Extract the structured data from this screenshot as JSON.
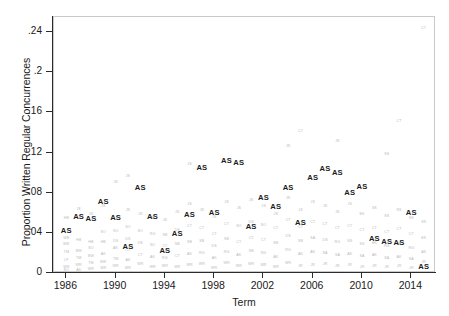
{
  "chart_data": {
    "type": "scatter",
    "title": "",
    "xlabel": "Term",
    "ylabel": "Proportion Written Regular Concurrences",
    "xlim": [
      1985,
      2016
    ],
    "ylim": [
      0,
      0.255
    ],
    "xticks": [
      "1986",
      "1990",
      "1994",
      "1998",
      "2002",
      "2006",
      "2010",
      "2014"
    ],
    "xtick_values": [
      1986,
      1990,
      1994,
      1998,
      2002,
      2006,
      2010,
      2014
    ],
    "yticks": [
      "0",
      ".04",
      ".08",
      ".12",
      ".16",
      ".2",
      ".24"
    ],
    "ytick_values": [
      0,
      0.04,
      0.08,
      0.12,
      0.16,
      0.2,
      0.24
    ],
    "grid": false,
    "legend": false,
    "marker_style": "text-initials",
    "series": [
      {
        "name": "Scalia",
        "label": "AS",
        "color": "#1c1c1c",
        "emphasis": "bold",
        "points": [
          {
            "x": 1986,
            "y": 0.042
          },
          {
            "x": 1987,
            "y": 0.056
          },
          {
            "x": 1988,
            "y": 0.054
          },
          {
            "x": 1989,
            "y": 0.071
          },
          {
            "x": 1990,
            "y": 0.055
          },
          {
            "x": 1991,
            "y": 0.026
          },
          {
            "x": 1992,
            "y": 0.085
          },
          {
            "x": 1993,
            "y": 0.056
          },
          {
            "x": 1994,
            "y": 0.022
          },
          {
            "x": 1995,
            "y": 0.039
          },
          {
            "x": 1996,
            "y": 0.058
          },
          {
            "x": 1997,
            "y": 0.105
          },
          {
            "x": 1998,
            "y": 0.06
          },
          {
            "x": 1999,
            "y": 0.112
          },
          {
            "x": 2000,
            "y": 0.11
          },
          {
            "x": 2001,
            "y": 0.046
          },
          {
            "x": 2002,
            "y": 0.075
          },
          {
            "x": 2003,
            "y": 0.066
          },
          {
            "x": 2004,
            "y": 0.085
          },
          {
            "x": 2005,
            "y": 0.05
          },
          {
            "x": 2006,
            "y": 0.095
          },
          {
            "x": 2007,
            "y": 0.104
          },
          {
            "x": 2008,
            "y": 0.1
          },
          {
            "x": 2009,
            "y": 0.08
          },
          {
            "x": 2010,
            "y": 0.086
          },
          {
            "x": 2011,
            "y": 0.034
          },
          {
            "x": 2012,
            "y": 0.031
          },
          {
            "x": 2013,
            "y": 0.03
          },
          {
            "x": 2014,
            "y": 0.06
          },
          {
            "x": 2015,
            "y": 0.006
          }
        ]
      },
      {
        "name": "Other Justices",
        "color": "#b9b9b9",
        "emphasis": "normal",
        "points": [
          {
            "x": 1986,
            "y": 0.054,
            "label": "HB"
          },
          {
            "x": 1986,
            "y": 0.034,
            "label": "WB"
          },
          {
            "x": 1986,
            "y": 0.028,
            "label": "BW"
          },
          {
            "x": 1986,
            "y": 0.02,
            "label": "TM"
          },
          {
            "x": 1986,
            "y": 0.012,
            "label": "LP"
          },
          {
            "x": 1986,
            "y": 0.005,
            "label": "WR"
          },
          {
            "x": 1986,
            "y": 0.002,
            "label": "SO"
          },
          {
            "x": 1987,
            "y": 0.063,
            "label": "JS"
          },
          {
            "x": 1987,
            "y": 0.032,
            "label": "HB"
          },
          {
            "x": 1987,
            "y": 0.021,
            "label": "BW"
          },
          {
            "x": 1987,
            "y": 0.014,
            "label": "TM"
          },
          {
            "x": 1987,
            "y": 0.007,
            "label": "WR"
          },
          {
            "x": 1987,
            "y": 0.002,
            "label": "AK"
          },
          {
            "x": 1988,
            "y": 0.058,
            "label": "JS"
          },
          {
            "x": 1988,
            "y": 0.03,
            "label": "HB"
          },
          {
            "x": 1988,
            "y": 0.024,
            "label": "SO"
          },
          {
            "x": 1988,
            "y": 0.016,
            "label": "BW"
          },
          {
            "x": 1988,
            "y": 0.009,
            "label": "TM"
          },
          {
            "x": 1988,
            "y": 0.003,
            "label": "WR"
          },
          {
            "x": 1989,
            "y": 0.066,
            "label": "JS"
          },
          {
            "x": 1989,
            "y": 0.04,
            "label": "SO"
          },
          {
            "x": 1989,
            "y": 0.03,
            "label": "HB"
          },
          {
            "x": 1989,
            "y": 0.018,
            "label": "AK"
          },
          {
            "x": 1989,
            "y": 0.01,
            "label": "BW"
          },
          {
            "x": 1989,
            "y": 0.004,
            "label": "WR"
          },
          {
            "x": 1990,
            "y": 0.09,
            "label": "JS"
          },
          {
            "x": 1990,
            "y": 0.041,
            "label": "SO"
          },
          {
            "x": 1990,
            "y": 0.031,
            "label": "DS"
          },
          {
            "x": 1990,
            "y": 0.024,
            "label": "AK"
          },
          {
            "x": 1990,
            "y": 0.013,
            "label": "TM"
          },
          {
            "x": 1990,
            "y": 0.006,
            "label": "WR"
          },
          {
            "x": 1991,
            "y": 0.062,
            "label": "JS"
          },
          {
            "x": 1991,
            "y": 0.045,
            "label": "SO"
          },
          {
            "x": 1991,
            "y": 0.033,
            "label": "DS"
          },
          {
            "x": 1991,
            "y": 0.022,
            "label": "CT"
          },
          {
            "x": 1991,
            "y": 0.012,
            "label": "AK"
          },
          {
            "x": 1991,
            "y": 0.004,
            "label": "WR"
          },
          {
            "x": 1992,
            "y": 0.058,
            "label": "JS"
          },
          {
            "x": 1992,
            "y": 0.041,
            "label": "SO"
          },
          {
            "x": 1992,
            "y": 0.029,
            "label": "DS"
          },
          {
            "x": 1992,
            "y": 0.017,
            "label": "CT"
          },
          {
            "x": 1992,
            "y": 0.008,
            "label": "WR"
          },
          {
            "x": 1993,
            "y": 0.054,
            "label": "JS"
          },
          {
            "x": 1993,
            "y": 0.038,
            "label": "RG"
          },
          {
            "x": 1993,
            "y": 0.027,
            "label": "SO"
          },
          {
            "x": 1993,
            "y": 0.015,
            "label": "AK"
          },
          {
            "x": 1993,
            "y": 0.005,
            "label": "WR"
          },
          {
            "x": 1994,
            "y": 0.052,
            "label": "JS"
          },
          {
            "x": 1994,
            "y": 0.037,
            "label": "SB"
          },
          {
            "x": 1994,
            "y": 0.026,
            "label": "CT"
          },
          {
            "x": 1994,
            "y": 0.014,
            "label": "RG"
          },
          {
            "x": 1994,
            "y": 0.006,
            "label": "WR"
          },
          {
            "x": 1995,
            "y": 0.06,
            "label": "JS"
          },
          {
            "x": 1995,
            "y": 0.042,
            "label": "DS"
          },
          {
            "x": 1995,
            "y": 0.028,
            "label": "SB"
          },
          {
            "x": 1995,
            "y": 0.016,
            "label": "CT"
          },
          {
            "x": 1995,
            "y": 0.005,
            "label": "WR"
          },
          {
            "x": 1996,
            "y": 0.068,
            "label": "JS"
          },
          {
            "x": 1996,
            "y": 0.046,
            "label": "CT"
          },
          {
            "x": 1996,
            "y": 0.03,
            "label": "SB"
          },
          {
            "x": 1996,
            "y": 0.018,
            "label": "AK"
          },
          {
            "x": 1996,
            "y": 0.007,
            "label": "WR"
          },
          {
            "x": 1997,
            "y": 0.062,
            "label": "JS"
          },
          {
            "x": 1997,
            "y": 0.044,
            "label": "CT"
          },
          {
            "x": 1997,
            "y": 0.031,
            "label": "SB"
          },
          {
            "x": 1997,
            "y": 0.019,
            "label": "RG"
          },
          {
            "x": 1997,
            "y": 0.008,
            "label": "WR"
          },
          {
            "x": 1998,
            "y": 0.055,
            "label": "JS"
          },
          {
            "x": 1998,
            "y": 0.038,
            "label": "CT"
          },
          {
            "x": 1998,
            "y": 0.026,
            "label": "DS"
          },
          {
            "x": 1998,
            "y": 0.014,
            "label": "AK"
          },
          {
            "x": 1998,
            "y": 0.004,
            "label": "WR"
          },
          {
            "x": 1999,
            "y": 0.07,
            "label": "JS"
          },
          {
            "x": 1999,
            "y": 0.048,
            "label": "CT"
          },
          {
            "x": 1999,
            "y": 0.033,
            "label": "SB"
          },
          {
            "x": 1999,
            "y": 0.02,
            "label": "RG"
          },
          {
            "x": 1999,
            "y": 0.009,
            "label": "WR"
          },
          {
            "x": 2000,
            "y": 0.064,
            "label": "JS"
          },
          {
            "x": 2000,
            "y": 0.046,
            "label": "SO"
          },
          {
            "x": 2000,
            "y": 0.03,
            "label": "CT"
          },
          {
            "x": 2000,
            "y": 0.017,
            "label": "AK"
          },
          {
            "x": 2000,
            "y": 0.006,
            "label": "WR"
          },
          {
            "x": 2001,
            "y": 0.072,
            "label": "JS"
          },
          {
            "x": 2001,
            "y": 0.05,
            "label": "DS"
          },
          {
            "x": 2001,
            "y": 0.034,
            "label": "CT"
          },
          {
            "x": 2001,
            "y": 0.021,
            "label": "SB"
          },
          {
            "x": 2001,
            "y": 0.008,
            "label": "WR"
          },
          {
            "x": 2002,
            "y": 0.066,
            "label": "JS"
          },
          {
            "x": 2002,
            "y": 0.047,
            "label": "SO"
          },
          {
            "x": 2002,
            "y": 0.032,
            "label": "CT"
          },
          {
            "x": 2002,
            "y": 0.019,
            "label": "RG"
          },
          {
            "x": 2002,
            "y": 0.007,
            "label": "WR"
          },
          {
            "x": 2003,
            "y": 0.058,
            "label": "JS"
          },
          {
            "x": 2003,
            "y": 0.044,
            "label": "CT"
          },
          {
            "x": 2003,
            "y": 0.029,
            "label": "SB"
          },
          {
            "x": 2003,
            "y": 0.015,
            "label": "AK"
          },
          {
            "x": 2003,
            "y": 0.005,
            "label": "WR"
          },
          {
            "x": 2004,
            "y": 0.074,
            "label": "JS"
          },
          {
            "x": 2004,
            "y": 0.052,
            "label": "CT"
          },
          {
            "x": 2004,
            "y": 0.036,
            "label": "DS"
          },
          {
            "x": 2004,
            "y": 0.022,
            "label": "RG"
          },
          {
            "x": 2004,
            "y": 0.009,
            "label": "WR"
          },
          {
            "x": 2005,
            "y": 0.062,
            "label": "JS"
          },
          {
            "x": 2005,
            "y": 0.045,
            "label": "CT"
          },
          {
            "x": 2005,
            "y": 0.031,
            "label": "SB"
          },
          {
            "x": 2005,
            "y": 0.018,
            "label": "AK"
          },
          {
            "x": 2005,
            "y": 0.006,
            "label": "JR"
          },
          {
            "x": 2006,
            "y": 0.07,
            "label": "JS"
          },
          {
            "x": 2006,
            "y": 0.05,
            "label": "CT"
          },
          {
            "x": 2006,
            "y": 0.034,
            "label": "SA"
          },
          {
            "x": 2006,
            "y": 0.02,
            "label": "AK"
          },
          {
            "x": 2006,
            "y": 0.007,
            "label": "JR"
          },
          {
            "x": 2007,
            "y": 0.066,
            "label": "JS"
          },
          {
            "x": 2007,
            "y": 0.048,
            "label": "CT"
          },
          {
            "x": 2007,
            "y": 0.032,
            "label": "DS"
          },
          {
            "x": 2007,
            "y": 0.019,
            "label": "SA"
          },
          {
            "x": 2007,
            "y": 0.008,
            "label": "JR"
          },
          {
            "x": 2008,
            "y": 0.06,
            "label": "JS"
          },
          {
            "x": 2008,
            "y": 0.044,
            "label": "CT"
          },
          {
            "x": 2008,
            "y": 0.03,
            "label": "RG"
          },
          {
            "x": 2008,
            "y": 0.017,
            "label": "SA"
          },
          {
            "x": 2008,
            "y": 0.006,
            "label": "JR"
          },
          {
            "x": 2009,
            "y": 0.068,
            "label": "JS"
          },
          {
            "x": 2009,
            "y": 0.046,
            "label": "CT"
          },
          {
            "x": 2009,
            "y": 0.031,
            "label": "SS"
          },
          {
            "x": 2009,
            "y": 0.018,
            "label": "AK"
          },
          {
            "x": 2009,
            "y": 0.007,
            "label": "JR"
          },
          {
            "x": 2010,
            "y": 0.058,
            "label": "EK"
          },
          {
            "x": 2010,
            "y": 0.042,
            "label": "CT"
          },
          {
            "x": 2010,
            "y": 0.028,
            "label": "SS"
          },
          {
            "x": 2010,
            "y": 0.016,
            "label": "SA"
          },
          {
            "x": 2010,
            "y": 0.005,
            "label": "JR"
          },
          {
            "x": 2011,
            "y": 0.064,
            "label": "SS"
          },
          {
            "x": 2011,
            "y": 0.044,
            "label": "CT"
          },
          {
            "x": 2011,
            "y": 0.029,
            "label": "EK"
          },
          {
            "x": 2011,
            "y": 0.017,
            "label": "AK"
          },
          {
            "x": 2011,
            "y": 0.006,
            "label": "JR"
          },
          {
            "x": 2012,
            "y": 0.056,
            "label": "SS"
          },
          {
            "x": 2012,
            "y": 0.04,
            "label": "CT"
          },
          {
            "x": 2012,
            "y": 0.026,
            "label": "RG"
          },
          {
            "x": 2012,
            "y": 0.014,
            "label": "SA"
          },
          {
            "x": 2012,
            "y": 0.005,
            "label": "JR"
          },
          {
            "x": 2013,
            "y": 0.062,
            "label": "SS"
          },
          {
            "x": 2013,
            "y": 0.043,
            "label": "CT"
          },
          {
            "x": 2013,
            "y": 0.028,
            "label": "EK"
          },
          {
            "x": 2013,
            "y": 0.015,
            "label": "AK"
          },
          {
            "x": 2013,
            "y": 0.006,
            "label": "JR"
          },
          {
            "x": 2014,
            "y": 0.054,
            "label": "SS"
          },
          {
            "x": 2014,
            "y": 0.038,
            "label": "CT"
          },
          {
            "x": 2014,
            "y": 0.024,
            "label": "RG"
          },
          {
            "x": 2014,
            "y": 0.013,
            "label": "SA"
          },
          {
            "x": 2014,
            "y": 0.004,
            "label": "JR"
          },
          {
            "x": 2015,
            "y": 0.243,
            "label": "CT"
          },
          {
            "x": 2015,
            "y": 0.05,
            "label": "SS"
          },
          {
            "x": 2015,
            "y": 0.034,
            "label": "EK"
          },
          {
            "x": 2015,
            "y": 0.02,
            "label": "AK"
          },
          {
            "x": 2015,
            "y": 0.01,
            "label": "JR"
          },
          {
            "x": 1991,
            "y": 0.096,
            "label": "JS"
          },
          {
            "x": 1996,
            "y": 0.108,
            "label": "JS"
          },
          {
            "x": 2004,
            "y": 0.126,
            "label": "JS"
          },
          {
            "x": 2008,
            "y": 0.13,
            "label": "JS"
          },
          {
            "x": 2012,
            "y": 0.118,
            "label": "SS"
          },
          {
            "x": 2013,
            "y": 0.15,
            "label": "CT"
          },
          {
            "x": 2005,
            "y": 0.14,
            "label": "CT"
          }
        ]
      }
    ]
  },
  "caption": {
    "text": ""
  }
}
